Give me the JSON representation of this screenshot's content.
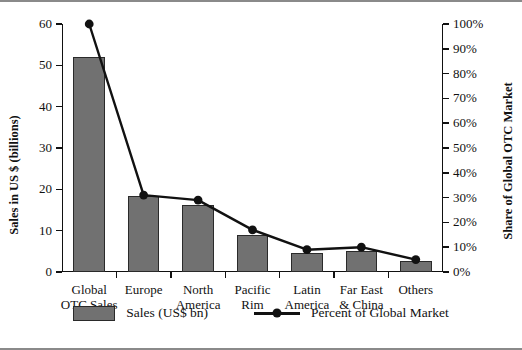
{
  "chart_data": {
    "type": "bar",
    "title": "",
    "subtitle": "",
    "categories": [
      "Global\nOTC Sales",
      "Europe",
      "North\nAmerica",
      "Pacific\nRim",
      "Latin\nAmerica",
      "Far East\n& China",
      "Others"
    ],
    "category_lines": [
      [
        "Global",
        "OTC Sales"
      ],
      [
        "Europe",
        ""
      ],
      [
        "North",
        "America"
      ],
      [
        "Pacific",
        "Rim"
      ],
      [
        "Latin",
        "America"
      ],
      [
        "Far East",
        "& China"
      ],
      [
        "Others",
        ""
      ]
    ],
    "series": [
      {
        "name": "Sales (US$ bn)",
        "type": "bar",
        "axis": "left",
        "values": [
          52.0,
          18.3,
          16.2,
          9.0,
          4.5,
          5.2,
          2.7
        ]
      },
      {
        "name": "Percent of Global Market",
        "type": "line",
        "axis": "right",
        "values": [
          100,
          31,
          29,
          17,
          9,
          10,
          5
        ]
      }
    ],
    "xlabel": "",
    "ylabel": "Sales in US $ (billions)",
    "y2label": "Share of Global OTC Market",
    "ylim": [
      0,
      60
    ],
    "y2lim": [
      0,
      100
    ],
    "yticks": [
      0,
      10,
      20,
      30,
      40,
      50,
      60
    ],
    "ytick_labels": [
      "0",
      "10",
      "20",
      "30",
      "40",
      "50",
      "60"
    ],
    "y2ticks": [
      0,
      10,
      20,
      30,
      40,
      50,
      60,
      70,
      80,
      90,
      100
    ],
    "y2tick_labels": [
      "0%",
      "10%",
      "20%",
      "30%",
      "40%",
      "50%",
      "60%",
      "70%",
      "80%",
      "90%",
      "100%"
    ],
    "grid": false,
    "legend_position": "bottom",
    "colors": {
      "bar_fill": "#717171",
      "bar_edge": "#2a2a2a",
      "line": "#111111",
      "marker": "#111111",
      "frame": "#8a8a8a",
      "background": "#ffffff"
    }
  },
  "legend": {
    "items": [
      {
        "label": "Sales (US$ bn)",
        "marker": "swatch"
      },
      {
        "label": "Percent of Global Market",
        "marker": "line-dot"
      }
    ]
  }
}
